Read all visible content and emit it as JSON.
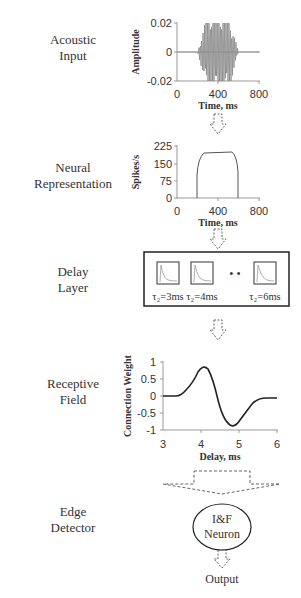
{
  "stages": [
    {
      "line1": "Acoustic",
      "line2": "Input"
    },
    {
      "line1": "Neural",
      "line2": "Representation"
    },
    {
      "line1": "Delay",
      "line2": "Layer"
    },
    {
      "line1": "Receptive",
      "line2": "Field"
    },
    {
      "line1": "Edge",
      "line2": "Detector"
    }
  ],
  "acoustic_plot": {
    "ylabel": "Amplitude",
    "xlabel": "Time, ms",
    "yticks": [
      "0.02",
      "0",
      "-0.02"
    ],
    "xticks": [
      "0",
      "400",
      "800"
    ]
  },
  "neural_plot": {
    "ylabel": "Spikes/s",
    "xlabel": "Time, ms",
    "yticks": [
      "225",
      "150",
      "75",
      "0"
    ],
    "xticks": [
      "0",
      "400",
      "800"
    ]
  },
  "delay_layer": {
    "units": [
      "τ₂=3ms",
      "τ₂=4ms",
      "τ₂=6ms"
    ],
    "ellipsis": "• •"
  },
  "receptive_plot": {
    "ylabel": "Connection Weight",
    "xlabel": "Delay, ms",
    "yticks": [
      "1",
      "0.5",
      "0",
      "-0.5",
      "-1"
    ],
    "xticks": [
      "3",
      "4",
      "5",
      "6"
    ]
  },
  "neuron": {
    "line1": "I&F",
    "line2": "Neuron"
  },
  "output_label": "Output",
  "chart_data": [
    {
      "type": "line",
      "title": "Acoustic Input",
      "xlabel": "Time, ms",
      "ylabel": "Amplitude",
      "xlim": [
        0,
        800
      ],
      "ylim": [
        -0.02,
        0.02
      ],
      "xticks": [
        0,
        400,
        800
      ],
      "yticks": [
        -0.02,
        0,
        0.02
      ],
      "description": "Oscillating waveform, silent before ~200 ms, ramps up to saturate at ±0.02 between ~300–500 ms, ramps down to zero by ~600 ms"
    },
    {
      "type": "line",
      "title": "Neural Representation",
      "xlabel": "Time, ms",
      "ylabel": "Spikes/s",
      "xlim": [
        0,
        800
      ],
      "ylim": [
        0,
        225
      ],
      "xticks": [
        0,
        400,
        800
      ],
      "yticks": [
        0,
        75,
        150,
        225
      ],
      "x": [
        0,
        200,
        200,
        230,
        300,
        500,
        570,
        600,
        600,
        800
      ],
      "values": [
        0,
        0,
        110,
        175,
        198,
        198,
        175,
        110,
        0,
        0
      ]
    },
    {
      "type": "line",
      "title": "Receptive Field",
      "xlabel": "Delay, ms",
      "ylabel": "Connection Weight",
      "xlim": [
        3,
        6
      ],
      "ylim": [
        -1,
        1
      ],
      "xticks": [
        3,
        4,
        5,
        6
      ],
      "yticks": [
        -1,
        -0.5,
        0,
        0.5,
        1
      ],
      "x": [
        3.0,
        3.4,
        3.6,
        3.8,
        4.0,
        4.2,
        4.4,
        4.6,
        4.8,
        5.0,
        5.2,
        5.4,
        5.6,
        6.0
      ],
      "values": [
        0,
        0.02,
        0.1,
        0.35,
        0.7,
        0.82,
        0.5,
        -0.3,
        -0.85,
        -0.75,
        -0.45,
        -0.2,
        -0.07,
        -0.07
      ]
    }
  ]
}
